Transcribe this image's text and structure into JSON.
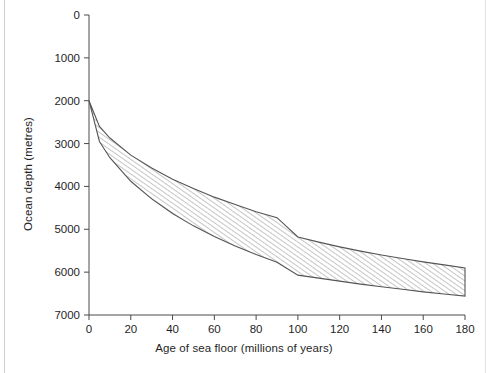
{
  "figure": {
    "background": "#ffffff",
    "ink_color": "#1f1f1f",
    "axis_color": "#4a4a4a",
    "band_stroke": "#555555",
    "hatch_color": "#7a7a7a"
  },
  "chart_data": {
    "type": "area",
    "title": "",
    "subtitle": "",
    "xlabel": "Age of sea floor (millions of years)",
    "ylabel": "Ocean depth (metres)",
    "xlim": [
      0,
      180
    ],
    "ylim": [
      0,
      7000
    ],
    "y_inverted": true,
    "grid": false,
    "legend": null,
    "xticks": [
      0,
      20,
      40,
      60,
      80,
      100,
      120,
      140,
      160,
      180
    ],
    "xtick_labels": [
      "0",
      "20",
      "40",
      "60",
      "80",
      "100",
      "120",
      "140",
      "160",
      "180"
    ],
    "yticks": [
      0,
      1000,
      2000,
      3000,
      4000,
      5000,
      6000,
      7000
    ],
    "ytick_labels": [
      "0",
      "1000",
      "2000",
      "3000",
      "4000",
      "5000",
      "6000",
      "7000"
    ],
    "fill_style": "diagonal-hatch",
    "annotations": [],
    "x": [
      0,
      5,
      10,
      20,
      30,
      40,
      50,
      60,
      70,
      80,
      90,
      100,
      110,
      120,
      130,
      140,
      150,
      160,
      170,
      180
    ],
    "series": [
      {
        "name": "Shallow bound of observed ocean depth",
        "role": "upper",
        "values": [
          2000,
          2600,
          2870,
          3270,
          3570,
          3830,
          4050,
          4250,
          4420,
          4590,
          4730,
          5180,
          5300,
          5410,
          5510,
          5600,
          5680,
          5760,
          5830,
          5900
        ]
      },
      {
        "name": "Deep bound of observed ocean depth",
        "role": "lower",
        "values": [
          2000,
          2950,
          3330,
          3880,
          4290,
          4630,
          4920,
          5170,
          5390,
          5590,
          5770,
          6070,
          6140,
          6210,
          6280,
          6340,
          6400,
          6460,
          6510,
          6560
        ]
      }
    ]
  },
  "edge_artifacts": {
    "left_rule": true,
    "right_rule": true
  }
}
